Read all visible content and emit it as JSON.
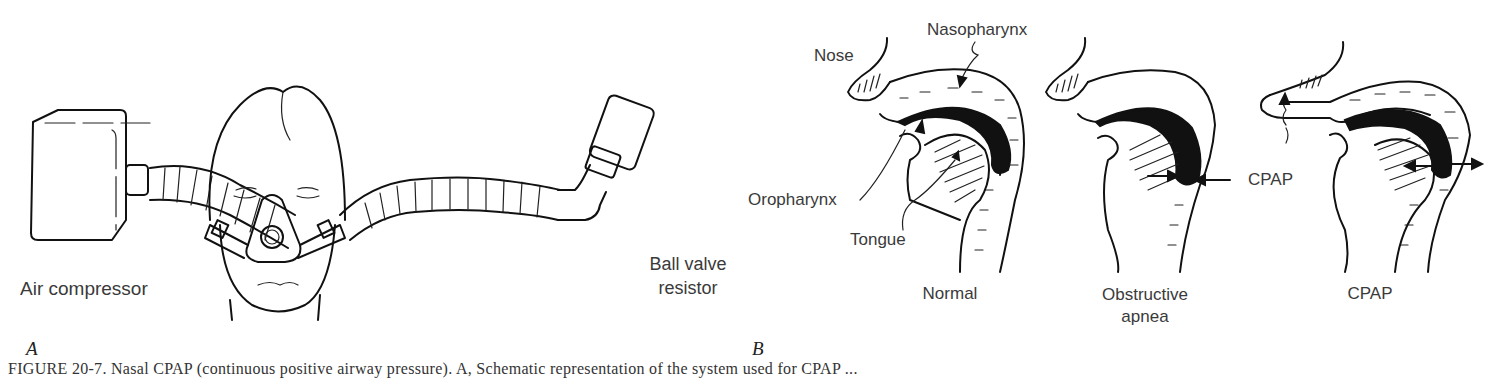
{
  "figure": {
    "panel_a": {
      "letter": "A",
      "labels": {
        "air_compressor": "Air compressor",
        "ball_valve_line1": "Ball valve",
        "ball_valve_line2": "resistor"
      }
    },
    "panel_b": {
      "letter": "B",
      "labels": {
        "nose": "Nose",
        "nasopharynx": "Nasopharynx",
        "oropharynx": "Oropharynx",
        "tongue": "Tongue",
        "cpap_arrow_label": "CPAP"
      },
      "subfigures": [
        {
          "title_line1": "Normal",
          "title_line2": ""
        },
        {
          "title_line1": "Obstructive",
          "title_line2": "apnea"
        },
        {
          "title_line1": "CPAP",
          "title_line2": ""
        }
      ]
    },
    "caption": "FIGURE 20-7. Nasal CPAP (continuous positive airway pressure). A, Schematic representation of the system used for CPAP ...",
    "colors": {
      "ink": "#111111",
      "background": "#ffffff",
      "text": "#3a3a3a"
    }
  }
}
